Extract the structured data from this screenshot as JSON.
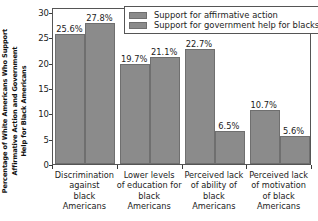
{
  "chart_data": {
    "type": "bar",
    "title": "",
    "xlabel": "",
    "ylabel_line1": "Percentage of White Americans Who Support",
    "ylabel_line2": "Affirmative Action and Government",
    "ylabel_line3": "Help for Black Americans",
    "ylabel": "Percentage of White Americans Who Support Affirmative Action and Government Help for Black Americans",
    "ylim": [
      0,
      31
    ],
    "yticks": [
      0,
      5,
      10,
      15,
      20,
      25,
      30
    ],
    "ytick_labels": [
      "0",
      "5",
      "10",
      "15",
      "20",
      "25",
      "30"
    ],
    "grid": false,
    "legend_position": "top-right",
    "bar_color": "#8b8b8b",
    "bar_edge_color": "#6f6f6f",
    "categories": [
      "Discrimination against black Americans",
      "Lower levels of education for black Americans",
      "Perceived lack of ability of black Americans",
      "Perceived lack of motivation of black Americans"
    ],
    "category_lines": [
      [
        "Discrimination",
        "against",
        "black",
        "Americans"
      ],
      [
        "Lower levels",
        "of education for",
        "black",
        "Americans"
      ],
      [
        "Perceived lack",
        "of ability of",
        "black",
        "Americans"
      ],
      [
        "Perceived lack",
        "of motivation",
        "of black",
        "Americans"
      ]
    ],
    "series": [
      {
        "name": "Support for affirmative action",
        "values": [
          25.6,
          19.7,
          22.7,
          10.7
        ],
        "labels": [
          "25.6%",
          "19.7%",
          "22.7%",
          "10.7%"
        ]
      },
      {
        "name": "Support for government help for blacks",
        "values": [
          27.8,
          21.1,
          6.5,
          5.6
        ],
        "labels": [
          "27.8%",
          "21.1%",
          "6.5%",
          "5.6%"
        ]
      }
    ]
  },
  "legend": {
    "items": [
      {
        "label": "Support for affirmative action"
      },
      {
        "label": "Support for government help for blacks"
      }
    ]
  }
}
